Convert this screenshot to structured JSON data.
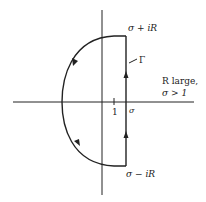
{
  "diagram": {
    "contour_name": "Γ",
    "top_label": "σ + iR",
    "bottom_label": "σ − iR",
    "tick_label_one": "1",
    "sigma_label": "σ",
    "condition_line1": "R large,",
    "condition_line2": "σ > 1",
    "colors": {
      "stroke": "#222222",
      "background": "#ffffff"
    }
  }
}
